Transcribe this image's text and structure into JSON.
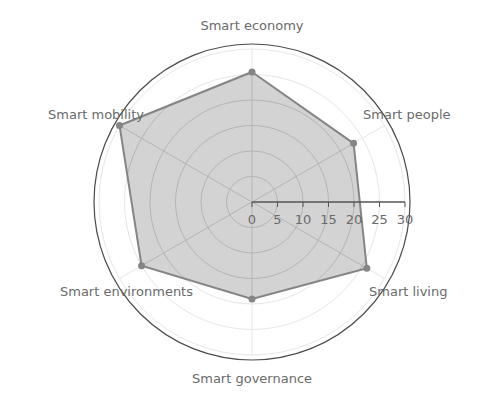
{
  "chart_data": {
    "type": "radar",
    "title": "",
    "categories": [
      "Smart economy",
      "Smart people",
      "Smart living",
      "Smart governance",
      "Smart environments",
      "Smart mobility"
    ],
    "series": [
      {
        "name": "",
        "values": [
          25.5,
          23,
          26,
          19,
          25,
          30
        ],
        "fill": "#d3d3d3",
        "line": "#858585"
      }
    ],
    "radial_axis": {
      "range": [
        0,
        30
      ],
      "ticks": [
        0,
        5,
        10,
        15,
        20,
        25,
        30
      ],
      "tick_labels": [
        "0",
        "5",
        "10",
        "15",
        "20",
        "25",
        "30"
      ],
      "angle_deg": 0
    },
    "grid": true,
    "legend": false
  },
  "layout": {
    "center": [
      252,
      202
    ],
    "px_per_unit": 5.1,
    "frame_radius": 158,
    "colors": {
      "grid_outside": "#e6e6e6",
      "grid_inside": "#b4b4b4",
      "frame": "#4a4a4a",
      "axis_line": "#555555",
      "text": "#6a6a6a"
    }
  }
}
